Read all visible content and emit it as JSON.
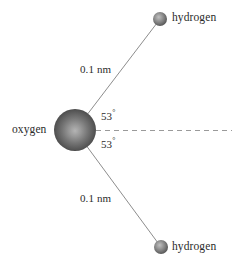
{
  "figure": {
    "background_color": "#ffffff",
    "atoms": [
      {
        "id": "oxygen",
        "label": "oxygen",
        "element": "O",
        "cx": 75,
        "cy": 130,
        "r": 21,
        "color_center": "#9a9a9a",
        "color_edge": "#343434"
      },
      {
        "id": "hydrogen-top",
        "label": "hydrogen",
        "element": "H",
        "cx": 160,
        "cy": 19,
        "r": 7,
        "color_center": "#a8a8a8",
        "color_edge": "#4a4a4a"
      },
      {
        "id": "hydrogen-bottom",
        "label": "hydrogen",
        "element": "H",
        "cx": 161,
        "cy": 247,
        "r": 7,
        "color_center": "#a8a8a8",
        "color_edge": "#4a4a4a"
      }
    ],
    "bonds": [
      {
        "id": "bond-top",
        "from": "oxygen",
        "to": "hydrogen-top",
        "length_label": "0.1 nm",
        "color": "#8d8d8d"
      },
      {
        "id": "bond-bottom",
        "from": "oxygen",
        "to": "hydrogen-bottom",
        "length_label": "0.1 nm",
        "color": "#8d8d8d"
      }
    ],
    "reference_axis": {
      "id": "horizontal-axis",
      "style": "dashed",
      "color": "#9a9a9a",
      "x1": 96,
      "x2": 232,
      "y": 130
    },
    "angles": [
      {
        "id": "angle-top",
        "value": "53",
        "unit": "°",
        "text": "53°",
        "between": "bond-top and horizontal-axis"
      },
      {
        "id": "angle-bottom",
        "value": "53",
        "unit": "°",
        "text": "53°",
        "between": "bond-bottom and horizontal-axis"
      }
    ],
    "labels": {
      "oxygen": "oxygen",
      "hydrogen_top": "hydrogen",
      "hydrogen_bottom": "hydrogen",
      "distance_top": "0.1 nm",
      "distance_bottom": "0.1 nm",
      "angle_top_value": "53",
      "angle_bottom_value": "53",
      "degree_symbol": "°"
    }
  }
}
